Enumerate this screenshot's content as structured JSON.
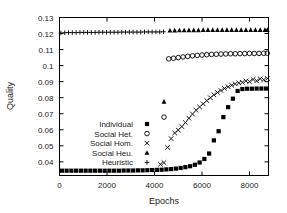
{
  "chart_data": {
    "type": "scatter",
    "title": "",
    "xlabel": "Epochs",
    "ylabel": "Quality",
    "xlim": [
      0,
      8800
    ],
    "ylim": [
      0.0315,
      0.13
    ],
    "grid": false,
    "legend_position": "lower-left-inside",
    "xticks": [
      0,
      2000,
      4000,
      6000,
      8000
    ],
    "xtick_labels": [
      "0",
      "2000",
      "4000",
      "6000",
      "8000"
    ],
    "yticks": [
      0.04,
      0.05,
      0.06,
      0.07,
      0.08,
      0.09,
      0.1,
      0.11,
      0.12,
      0.13
    ],
    "ytick_labels": [
      "0.04",
      "0.05",
      "0.06",
      "0.07",
      "0.08",
      "0.09",
      "0.1",
      "0.11",
      "0.12",
      "0.13"
    ],
    "series": [
      {
        "name": "Individual",
        "marker": "filled-square",
        "x": [
          100,
          300,
          500,
          700,
          900,
          1100,
          1300,
          1500,
          1700,
          1900,
          2100,
          2300,
          2500,
          2700,
          2900,
          3100,
          3300,
          3500,
          3700,
          3900,
          4100,
          4300,
          4500,
          4700,
          4900,
          5100,
          5300,
          5500,
          5700,
          5900,
          6100,
          6300,
          6500,
          6700,
          6900,
          7100,
          7300,
          7500,
          7700,
          7900,
          8100,
          8300,
          8500,
          8700
        ],
        "values": [
          0.0345,
          0.0345,
          0.0345,
          0.0345,
          0.0345,
          0.0345,
          0.0345,
          0.0345,
          0.0345,
          0.0345,
          0.0345,
          0.0345,
          0.0345,
          0.0346,
          0.0346,
          0.0346,
          0.0347,
          0.0347,
          0.0348,
          0.0349,
          0.035,
          0.0351,
          0.0353,
          0.0355,
          0.0358,
          0.0362,
          0.0367,
          0.0373,
          0.0382,
          0.0396,
          0.0418,
          0.0452,
          0.0534,
          0.0591,
          0.0679,
          0.0741,
          0.0794,
          0.0842,
          0.0854,
          0.0856,
          0.0856,
          0.0857,
          0.0857,
          0.0857
        ]
      },
      {
        "name": "Social Het.",
        "marker": "open-circle",
        "x": [
          4400,
          4600,
          4800,
          5000,
          5200,
          5400,
          5600,
          5800,
          6000,
          6200,
          6400,
          6600,
          6800,
          7000,
          7200,
          7400,
          7600,
          7800,
          8000,
          8200,
          8400,
          8600,
          8750
        ],
        "values": [
          0.0679,
          0.1042,
          0.1046,
          0.105,
          0.1054,
          0.1058,
          0.1061,
          0.1064,
          0.1066,
          0.1068,
          0.107,
          0.1071,
          0.1072,
          0.1073,
          0.1074,
          0.1074,
          0.1075,
          0.1075,
          0.1076,
          0.1076,
          0.1076,
          0.1077,
          0.1077
        ]
      },
      {
        "name": "Social Hom.",
        "marker": "cross-x",
        "x": [
          4250,
          4400,
          4550,
          4700,
          4850,
          5000,
          5150,
          5300,
          5450,
          5600,
          5750,
          5900,
          6050,
          6200,
          6350,
          6500,
          6650,
          6800,
          6950,
          7100,
          7250,
          7400,
          7550,
          7700,
          7850,
          8000,
          8150,
          8300,
          8450,
          8600,
          8750
        ],
        "values": [
          0.0385,
          0.0395,
          0.049,
          0.0545,
          0.058,
          0.0598,
          0.062,
          0.0645,
          0.0672,
          0.0698,
          0.0722,
          0.0742,
          0.0762,
          0.0782,
          0.08,
          0.0818,
          0.0832,
          0.0845,
          0.0858,
          0.0868,
          0.0878,
          0.0886,
          0.0892,
          0.0896,
          0.0905,
          0.09,
          0.0914,
          0.0905,
          0.0918,
          0.0912,
          0.092
        ]
      },
      {
        "name": "Social Heu.",
        "marker": "filled-triangle",
        "x": [
          4400,
          4650,
          4850,
          5050,
          5250,
          5450,
          5650,
          5850,
          6050,
          6250,
          6450,
          6650,
          6850,
          7050,
          7250,
          7450,
          7650,
          7850,
          8050,
          8250,
          8450,
          8650,
          8750
        ],
        "values": [
          0.0775,
          0.1218,
          0.1219,
          0.122,
          0.122,
          0.1221,
          0.1221,
          0.1221,
          0.1222,
          0.1222,
          0.1222,
          0.1222,
          0.1222,
          0.1222,
          0.1222,
          0.1222,
          0.1222,
          0.1222,
          0.1222,
          0.1222,
          0.1222,
          0.1222,
          0.1222
        ]
      },
      {
        "name": "Heuristic",
        "marker": "plus",
        "x": [
          60,
          220,
          380,
          540,
          700,
          860,
          1020,
          1180,
          1340,
          1500,
          1660,
          1820,
          1980,
          2140,
          2300,
          2460,
          2620,
          2780,
          2940,
          3100,
          3260,
          3420,
          3580,
          3740,
          3900,
          4060,
          4220,
          4380
        ],
        "values": [
          0.1203,
          0.1205,
          0.1206,
          0.1206,
          0.1206,
          0.1207,
          0.1207,
          0.1207,
          0.1207,
          0.1207,
          0.1208,
          0.1208,
          0.1208,
          0.1208,
          0.1208,
          0.1208,
          0.1209,
          0.1209,
          0.1209,
          0.1209,
          0.1209,
          0.1209,
          0.121,
          0.121,
          0.121,
          0.121,
          0.121,
          0.1211
        ]
      }
    ],
    "legend": [
      {
        "label": "Individual",
        "marker": "filled-square"
      },
      {
        "label": "Social Het.",
        "marker": "open-circle"
      },
      {
        "label": "Social Hom.",
        "marker": "cross-x"
      },
      {
        "label": "Social Heu.",
        "marker": "filled-triangle"
      },
      {
        "label": "Heuristic",
        "marker": "plus"
      }
    ]
  }
}
